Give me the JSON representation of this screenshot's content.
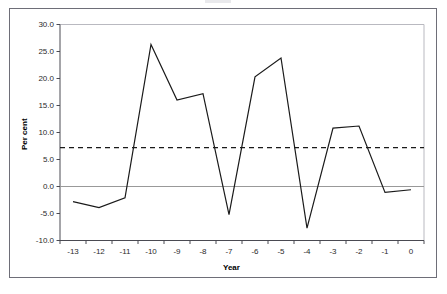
{
  "figure": {
    "background_color": "#ffffff",
    "border_color": "#6e6e78"
  },
  "axes": {
    "x_title": "Year",
    "y_title": "Per cent",
    "y_ticks": [
      "30.0",
      "25.0",
      "20.0",
      "15.0",
      "10.0",
      "5.0",
      "0.0",
      "-5.0",
      "-10.0"
    ],
    "x_ticks": [
      "-13",
      "-12",
      "-11",
      "-10",
      "-9",
      "-8",
      "-7",
      "-6",
      "-5",
      "-4",
      "-3",
      "-2",
      "-1",
      "0"
    ]
  },
  "chart_data": {
    "type": "line",
    "title": "",
    "subtitle": "",
    "xlabel": "Year",
    "ylabel": "Per cent",
    "categories": [
      "-13",
      "-12",
      "-11",
      "-10",
      "-9",
      "-8",
      "-7",
      "-6",
      "-5",
      "-4",
      "-3",
      "-2",
      "-1",
      "0"
    ],
    "series": [
      {
        "name": "Per cent",
        "values": [
          -2.8,
          -3.9,
          -2.1,
          26.3,
          16.0,
          17.2,
          -5.2,
          20.3,
          23.8,
          -7.7,
          10.8,
          11.2,
          -1.1,
          -0.6
        ],
        "line_color": "#1a1a1a",
        "line_style": "solid",
        "line_width": 1
      }
    ],
    "reference_lines": [
      {
        "name": "mean-reference-line",
        "orientation": "horizontal",
        "value": 7.2,
        "line_color": "#1a1a1a",
        "line_style": "dashed"
      },
      {
        "name": "zero-baseline",
        "orientation": "horizontal",
        "value": 0.0,
        "line_color": "#999999",
        "line_style": "solid"
      }
    ],
    "ylim": [
      -10.0,
      30.0
    ],
    "ytick_step": 5.0,
    "grid": false,
    "legend": false,
    "legend_position": "none"
  }
}
